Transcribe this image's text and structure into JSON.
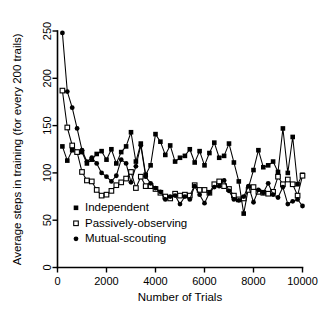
{
  "chart_data": {
    "type": "line",
    "title": "",
    "xlabel": "Number of Trials",
    "ylabel": "Average steps in training (for every 200 trails)",
    "xlim": [
      0,
      10000
    ],
    "ylim": [
      0,
      250
    ],
    "xticks": [
      0,
      2000,
      4000,
      6000,
      8000,
      10000
    ],
    "xtick_labels": [
      "0",
      "2000",
      "4000",
      "6000",
      "8000",
      "10000"
    ],
    "yticks": [
      0,
      50,
      100,
      150,
      200,
      250
    ],
    "ytick_labels": [
      "0",
      "50",
      "100",
      "150",
      "200",
      "250"
    ],
    "grid": false,
    "legend_position": "inside-lower-left",
    "x": [
      200,
      400,
      600,
      800,
      1000,
      1200,
      1400,
      1600,
      1800,
      2000,
      2200,
      2400,
      2600,
      2800,
      3000,
      3200,
      3400,
      3600,
      3800,
      4000,
      4200,
      4400,
      4600,
      4800,
      5000,
      5200,
      5400,
      5600,
      5800,
      6000,
      6200,
      6400,
      6600,
      6800,
      7000,
      7200,
      7400,
      7600,
      7800,
      8000,
      8200,
      8400,
      8600,
      8800,
      9000,
      9200,
      9400,
      9600,
      9800,
      10000
    ],
    "series": [
      {
        "name": "Independent",
        "marker": "filled-square",
        "values": [
          128,
          113,
          124,
          122,
          122,
          110,
          114,
          120,
          123,
          114,
          125,
          110,
          122,
          128,
          143,
          112,
          131,
          98,
          108,
          141,
          133,
          119,
          129,
          112,
          116,
          118,
          125,
          111,
          123,
          108,
          121,
          132,
          116,
          118,
          131,
          111,
          91,
          57,
          85,
          103,
          124,
          106,
          108,
          112,
          101,
          147,
          100,
          138,
          88,
          98
        ]
      },
      {
        "name": "Passively-observing",
        "marker": "open-square",
        "values": [
          187,
          148,
          129,
          122,
          101,
          92,
          91,
          82,
          76,
          77,
          81,
          87,
          90,
          94,
          101,
          84,
          96,
          86,
          86,
          83,
          79,
          75,
          73,
          78,
          76,
          77,
          76,
          87,
          82,
          82,
          79,
          88,
          91,
          86,
          83,
          76,
          72,
          73,
          82,
          85,
          80,
          79,
          78,
          80,
          96,
          88,
          93,
          88,
          76,
          97
        ]
      },
      {
        "name": "Mutual-scouting",
        "marker": "filled-circle",
        "values": [
          248,
          186,
          169,
          147,
          124,
          112,
          116,
          110,
          100,
          96,
          91,
          97,
          114,
          110,
          90,
          107,
          129,
          96,
          89,
          84,
          80,
          72,
          75,
          76,
          67,
          75,
          72,
          86,
          77,
          68,
          79,
          85,
          86,
          92,
          81,
          72,
          71,
          75,
          86,
          69,
          82,
          79,
          89,
          77,
          74,
          85,
          67,
          70,
          72,
          65
        ]
      }
    ]
  },
  "legend": {
    "items": [
      {
        "label": "Independent",
        "marker": "filled-square"
      },
      {
        "label": "Passively-observing",
        "marker": "open-square"
      },
      {
        "label": "Mutual-scouting",
        "marker": "filled-circle"
      }
    ]
  }
}
